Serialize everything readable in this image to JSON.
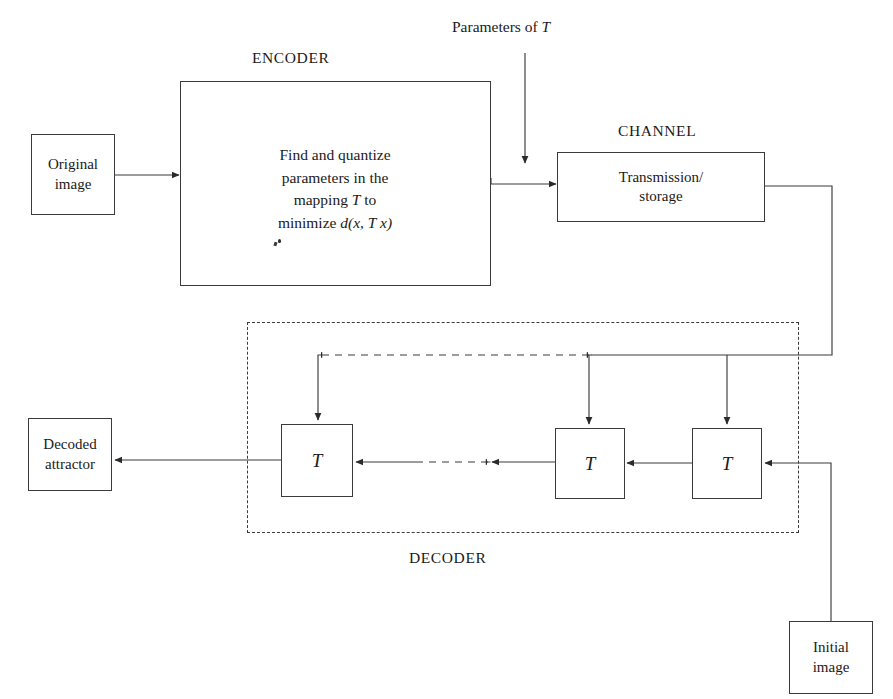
{
  "diagram": {
    "canvas": {
      "width": 893,
      "height": 699
    },
    "stroke_color": "#3b3b3b",
    "text_color": "#1a1a1a",
    "background": "#ffffff",
    "captions": {
      "encoder": "ENCODER",
      "channel": "CHANNEL",
      "decoder": "DECODER",
      "parameters": "Parameters of T"
    },
    "nodes": {
      "original_image": "Original\nimage",
      "encoder_body_line1": "Find and quantize",
      "encoder_body_line2": "parameters in the",
      "encoder_body_line3_pre": "mapping ",
      "encoder_body_line3_var": "T",
      "encoder_body_line3_post": " to",
      "encoder_body_line4_pre": "minimize ",
      "encoder_body_line4_expr": "d(x, T x)",
      "channel_body": "Transmission/\nstorage",
      "decoded_attractor": "Decoded\nattractor",
      "initial_image": "Initial\nimage",
      "transform_1": "T",
      "transform_2": "T",
      "transform_3": "T"
    }
  }
}
